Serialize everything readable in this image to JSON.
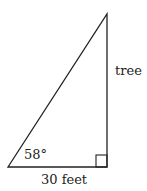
{
  "diagram": {
    "type": "right-triangle",
    "labels": {
      "vertical_side": "tree",
      "angle": "58°",
      "base": "30 feet"
    },
    "colors": {
      "stroke": "#222222",
      "background": "#ffffff"
    }
  }
}
